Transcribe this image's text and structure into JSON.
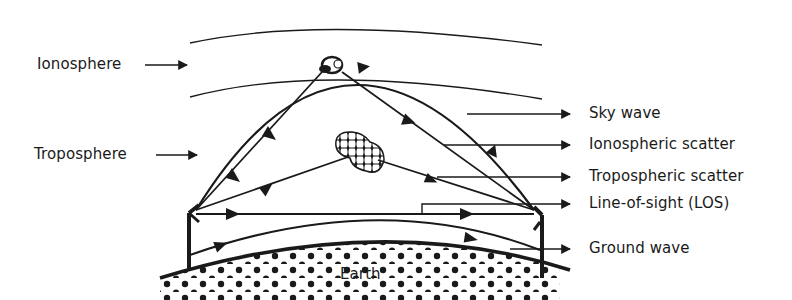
{
  "diagram": {
    "colors": {
      "ink": "#1a1a1a",
      "background": "#ffffff"
    },
    "left_labels": [
      {
        "id": "ionosphere",
        "text": "Ionosphere"
      },
      {
        "id": "troposphere",
        "text": "Troposphere"
      }
    ],
    "right_labels": [
      {
        "id": "sky-wave",
        "text": "Sky wave"
      },
      {
        "id": "ionospheric-scatter",
        "text": "Ionospheric scatter"
      },
      {
        "id": "tropospheric-scatter",
        "text": "Tropospheric scatter"
      },
      {
        "id": "line-of-sight",
        "text": "Line-of-sight (LOS)"
      },
      {
        "id": "ground-wave",
        "text": "Ground wave"
      }
    ],
    "earth_label": "Earth",
    "components": {
      "ionosphere_layer": "two curved boundary lines at top",
      "transmitter_antenna": "left vertical mast",
      "receiver_antenna": "right vertical mast",
      "ionospheric_scatter_region": "small blob in ionosphere",
      "tropospheric_scatter_region": "checkered blob in troposphere",
      "earth_surface": "dotted curved earth"
    }
  }
}
